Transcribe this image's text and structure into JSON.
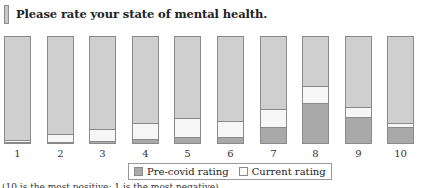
{
  "title": "Please rate your state of mental health.",
  "legend": {
    "pre": "Pre-covid rating",
    "current": "Current rating"
  },
  "footnote": "(10 is the most positive; 1 is the most negative)",
  "colors": {
    "background_bar": "#cfcfcf",
    "pre_covid": "#a9a9a9",
    "current": "#f6f6f6",
    "border": "#8a8a8a"
  },
  "chart_data": {
    "type": "bar",
    "title": "Please rate your state of mental health.",
    "xlabel": "",
    "ylabel": "",
    "categories": [
      "1",
      "2",
      "3",
      "4",
      "5",
      "6",
      "7",
      "8",
      "9",
      "10"
    ],
    "series": [
      {
        "name": "Pre-covid rating",
        "values": [
          1,
          1,
          2,
          4,
          6,
          6,
          15,
          37,
          24,
          15
        ]
      },
      {
        "name": "Current rating",
        "values": [
          2,
          7,
          11,
          15,
          18,
          15,
          17,
          16,
          9,
          4
        ]
      }
    ],
    "ylim": [
      0,
      100
    ],
    "stacked": true,
    "grid": false,
    "legend_position": "bottom"
  }
}
